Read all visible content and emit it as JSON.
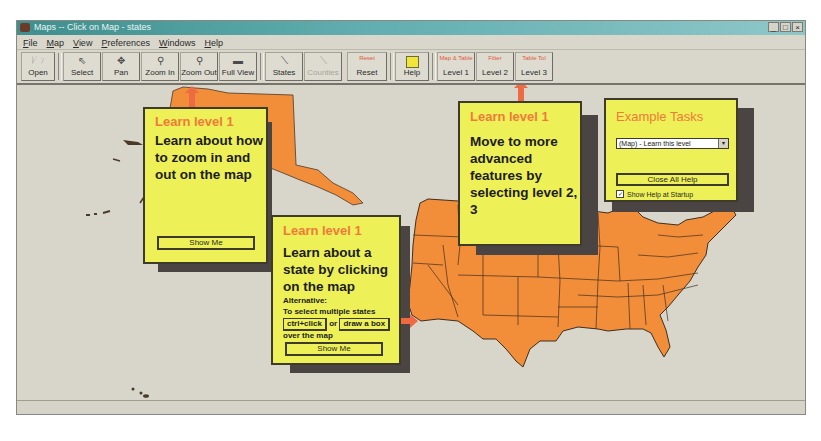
{
  "window": {
    "title": "Maps -- Click on Map - states",
    "controls": [
      "_",
      "□",
      "×"
    ]
  },
  "menu": [
    "File",
    "Map",
    "View",
    "Preferences",
    "Windows",
    "Help"
  ],
  "toolbar": {
    "buttons": [
      {
        "label": "Open",
        "icon": "folder-icon"
      },
      {
        "label": "Select",
        "icon": "pointer-icon"
      },
      {
        "label": "Pan",
        "icon": "pan-cross-icon"
      },
      {
        "label": "Zoom In",
        "icon": "magnifier-icon"
      },
      {
        "label": "Zoom Out",
        "icon": "magnifier-icon"
      },
      {
        "label": "Full View",
        "icon": "us-silhouette-icon"
      },
      {
        "label": "States",
        "icon": "states-line-icon"
      },
      {
        "label": "Counties",
        "icon": "counties-line-icon",
        "disabled": true
      },
      {
        "label": "Reset",
        "icon": "reset-icon",
        "icon_text": "Reset"
      },
      {
        "label": "Help",
        "icon": "help-sticky-icon"
      },
      {
        "label": "Level 1",
        "icon": "level1-icon",
        "icon_text": "Map & Table"
      },
      {
        "label": "Level 2",
        "icon": "level2-icon",
        "icon_text": "Filter"
      },
      {
        "label": "Level 3",
        "icon": "level3-icon",
        "icon_text": "Table Tol"
      }
    ]
  },
  "help": {
    "zoom": {
      "header": "Learn level 1",
      "body": "Learn about how to zoom in and out on the map",
      "button": "Show Me"
    },
    "state": {
      "header": "Learn level 1",
      "body": "Learn about a state by clicking on the map",
      "alt_label": "Alternative:",
      "alt_text": "To select multiple states",
      "ctrl_click": "ctrl+click",
      "or": "or",
      "draw_box": "draw a box",
      "over": "over the map",
      "button": "Show Me"
    },
    "levels": {
      "header": "Learn level 1",
      "body": "Move to more advanced features by selecting level 2, 3"
    },
    "tasks": {
      "header": "Example Tasks",
      "select_value": "(Map) - Learn this level",
      "close_button": "Close All Help",
      "checkbox_label": "Show Help at Startup",
      "checkbox_checked": true
    }
  },
  "colors": {
    "map_fill": "#f28d3a",
    "help_bg": "#eef057",
    "help_header": "#f07a3a",
    "arrow": "#ee6a43",
    "shadow": "#4a4443"
  }
}
